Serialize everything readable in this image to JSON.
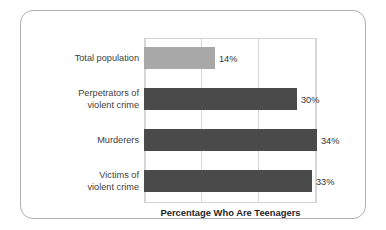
{
  "chart_data": {
    "type": "bar",
    "orientation": "horizontal",
    "title": "",
    "xlabel": "Percentage Who Are Teenagers",
    "ylabel": "",
    "categories": [
      "Total population",
      "Perpetrators of\nviolent crime",
      "Murderers",
      "Victims of\nviolent crime"
    ],
    "values": [
      14,
      30,
      34,
      33
    ],
    "value_labels": [
      "14%",
      "30%",
      "34%",
      "33%"
    ],
    "bar_colors": [
      "#a8a8a8",
      "#4a4a4a",
      "#4a4a4a",
      "#4a4a4a"
    ],
    "xlim": [
      0,
      34
    ],
    "grid": true,
    "gridline_count": 4,
    "legend": null
  },
  "figure": {
    "border_color": "#b0b0b0",
    "plot_border_color": "#d4d4d4",
    "gridline_color": "#d8d8d8",
    "label_color": "#404040",
    "axis_title_color": "#1f1f1f"
  }
}
